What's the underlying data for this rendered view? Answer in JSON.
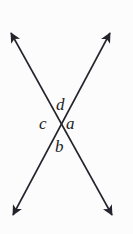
{
  "figure": {
    "kind": "vertical-angles-diagram",
    "width": 133,
    "height": 234,
    "background_color": "#fcfcfc",
    "line_color": "#24242c",
    "label_color": "#1d1d24",
    "line_width": 1.6,
    "intersection": {
      "x": 61,
      "y": 124
    },
    "lines": [
      {
        "name": "line-sw-ne",
        "x1": 13,
        "y1": 215,
        "x2": 110,
        "y2": 33,
        "arrow_start": true,
        "arrow_end": true
      },
      {
        "name": "line-nw-se",
        "x1": 11,
        "y1": 33,
        "x2": 112,
        "y2": 215,
        "arrow_start": true,
        "arrow_end": true
      }
    ],
    "arrowheads": [
      {
        "name": "arrowhead-top-left",
        "x": 11,
        "y": 33
      },
      {
        "name": "arrowhead-top-right",
        "x": 110,
        "y": 33
      },
      {
        "name": "arrowhead-bottom-left",
        "x": 13,
        "y": 215
      },
      {
        "name": "arrowhead-bottom-right",
        "x": 112,
        "y": 215
      }
    ],
    "labels": {
      "top": "d",
      "right": "a",
      "left": "c",
      "bottom": "b"
    }
  }
}
